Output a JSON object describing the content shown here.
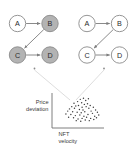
{
  "figure": {
    "background_color": "#ffffff",
    "palette": {
      "node_fill_highlighted": "#b3b3b3",
      "node_fill_plain": "#ffffff",
      "node_stroke": "#8a8a8a",
      "edge_color": "#7d7d7d",
      "connector_color": "#cfcfcf",
      "axis_color": "#6f6f6f",
      "dot_color": "#3c3c3c",
      "text_color": "#2b2b2b"
    }
  },
  "graphs": [
    {
      "id": "graph-left",
      "name": "left-graph",
      "nodes": [
        {
          "id": "A",
          "label": "A",
          "cx": 17.5,
          "cy": 23.5,
          "r": 8.2,
          "filled": false
        },
        {
          "id": "B",
          "label": "B",
          "cx": 50.0,
          "cy": 23.5,
          "r": 8.2,
          "filled": true
        },
        {
          "id": "C",
          "label": "C",
          "cx": 17.5,
          "cy": 55.0,
          "r": 8.2,
          "filled": true
        },
        {
          "id": "D",
          "label": "D",
          "cx": 50.0,
          "cy": 55.0,
          "r": 8.2,
          "filled": true
        }
      ],
      "edges": [
        {
          "id": "A-B",
          "from": "A",
          "to": "B",
          "arrow": true
        },
        {
          "id": "B-C",
          "from": "B",
          "to": "C",
          "arrow": true
        },
        {
          "id": "C-D",
          "from": "C",
          "to": "D",
          "arrow": true
        }
      ],
      "marker": {
        "x": 34.5,
        "y": 68.5
      }
    },
    {
      "id": "graph-right",
      "name": "right-graph",
      "nodes": [
        {
          "id": "A",
          "label": "A",
          "cx": 87.0,
          "cy": 23.5,
          "r": 8.2,
          "filled": false
        },
        {
          "id": "B",
          "label": "B",
          "cx": 119.5,
          "cy": 23.5,
          "r": 8.2,
          "filled": false
        },
        {
          "id": "C",
          "label": "C",
          "cx": 87.0,
          "cy": 55.0,
          "r": 8.2,
          "filled": false
        },
        {
          "id": "D",
          "label": "D",
          "cx": 119.5,
          "cy": 55.0,
          "r": 8.2,
          "filled": false
        }
      ],
      "edges": [
        {
          "id": "A-B",
          "from": "A",
          "to": "B",
          "arrow": true
        },
        {
          "id": "B-C",
          "from": "B",
          "to": "C",
          "arrow": true
        },
        {
          "id": "C-D",
          "from": "C",
          "to": "D",
          "arrow": true
        }
      ],
      "marker": {
        "x": 104.0,
        "y": 68.5
      }
    }
  ],
  "connectors": [
    {
      "id": "left-connector",
      "x1": 34.5,
      "y1": 70.0,
      "x2": 70.0,
      "y2": 100.0
    },
    {
      "id": "right-connector",
      "x1": 104.0,
      "y1": 70.0,
      "x2": 76.0,
      "y2": 100.0
    }
  ],
  "chart_data": {
    "type": "scatter",
    "title": "",
    "xlabel": "NFT velocity",
    "ylabel": "Price deviation",
    "ylabel_lines": [
      "Price",
      "deviation"
    ],
    "xlabel_lines": [
      "NFT",
      "velocity"
    ],
    "grid": false,
    "legend": "none",
    "axis_origin": {
      "x": 52.0,
      "y": 128.0
    },
    "axis_top": {
      "x": 52.0,
      "y": 93.0
    },
    "axis_right": {
      "x": 104.0,
      "y": 128.0
    },
    "xlim": [
      0,
      100
    ],
    "ylim": [
      0,
      100
    ],
    "points": [
      [
        54,
        88
      ],
      [
        61,
        92
      ],
      [
        48,
        80
      ],
      [
        66,
        84
      ],
      [
        72,
        90
      ],
      [
        40,
        74
      ],
      [
        57,
        76
      ],
      [
        63,
        70
      ],
      [
        50,
        66
      ],
      [
        70,
        72
      ],
      [
        35,
        62
      ],
      [
        44,
        64
      ],
      [
        58,
        60
      ],
      [
        67,
        62
      ],
      [
        76,
        66
      ],
      [
        30,
        54
      ],
      [
        41,
        56
      ],
      [
        52,
        52
      ],
      [
        60,
        50
      ],
      [
        73,
        56
      ],
      [
        83,
        60
      ],
      [
        26,
        46
      ],
      [
        37,
        44
      ],
      [
        47,
        42
      ],
      [
        56,
        40
      ],
      [
        64,
        44
      ],
      [
        78,
        46
      ],
      [
        88,
        50
      ],
      [
        22,
        36
      ],
      [
        33,
        34
      ],
      [
        43,
        30
      ],
      [
        53,
        32
      ],
      [
        62,
        28
      ],
      [
        71,
        34
      ],
      [
        81,
        38
      ],
      [
        92,
        42
      ],
      [
        28,
        24
      ],
      [
        39,
        22
      ],
      [
        49,
        18
      ],
      [
        58,
        20
      ],
      [
        68,
        24
      ],
      [
        77,
        20
      ],
      [
        86,
        28
      ],
      [
        95,
        32
      ],
      [
        45,
        12
      ],
      [
        55,
        10
      ],
      [
        65,
        14
      ],
      [
        74,
        12
      ],
      [
        84,
        16
      ],
      [
        90,
        22
      ]
    ]
  }
}
